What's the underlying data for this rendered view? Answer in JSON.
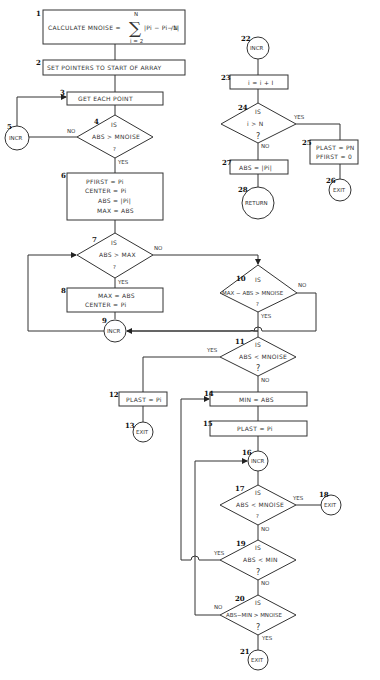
{
  "flowchart": {
    "nodes": {
      "n1": {
        "num": "1",
        "text": "CALCULATE  MNOISE =",
        "sum_upper": "N",
        "sum_lower": "i = 2",
        "sum_body": "|Pi − Pi−1|",
        "divisor": "/N"
      },
      "n2": {
        "num": "2",
        "text": "SET  POINTERS   TO  START  OF  ARRAY"
      },
      "n3": {
        "num": "3",
        "text": "GET    EACH    POINT"
      },
      "n4": {
        "num": "4",
        "is": "IS",
        "text": "ABS > MNOISE",
        "q": "?"
      },
      "n5": {
        "num": "5",
        "text": "INCR"
      },
      "n6": {
        "num": "6",
        "lines": [
          "PFIRST =  Pi",
          "CENTER =  Pi",
          "ABS =  |Pi|",
          "MAX =  ABS"
        ]
      },
      "n7": {
        "num": "7",
        "is": "IS",
        "text": "ABS > MAX",
        "q": "?"
      },
      "n8": {
        "num": "8",
        "lines": [
          "MAX = ABS",
          "CENTER =  Pi"
        ]
      },
      "n9": {
        "num": "9",
        "text": "INCR"
      },
      "n10": {
        "num": "10",
        "is": "IS",
        "text": "MAX − ABS > MNOISE",
        "q": "?"
      },
      "n11": {
        "num": "11",
        "is": "IS",
        "text": "ABS < MNOISE",
        "q": "?"
      },
      "n12": {
        "num": "12",
        "text": "PLAST = Pi"
      },
      "n13": {
        "num": "13",
        "text": "EXIT"
      },
      "n14": {
        "num": "14",
        "text": "MIN  =  ABS"
      },
      "n15": {
        "num": "15",
        "text": "PLAST  =  Pi"
      },
      "n16": {
        "num": "16",
        "text": "INCR"
      },
      "n17": {
        "num": "17",
        "is": "IS",
        "text": "ABS < MNOISE",
        "q": "?"
      },
      "n18": {
        "num": "18",
        "text": "EXIT"
      },
      "n19": {
        "num": "19",
        "is": "IS",
        "text": "ABS < MIN",
        "q": "?"
      },
      "n20": {
        "num": "20",
        "is": "IS",
        "text": "ABS−MIN > MNOISE",
        "q": "?"
      },
      "n21": {
        "num": "21",
        "text": "EXIT"
      },
      "n22": {
        "num": "22",
        "text": "INCR"
      },
      "n23": {
        "num": "23",
        "text": "i = i + I"
      },
      "n24": {
        "num": "24",
        "is": "IS",
        "text": "i  >  N",
        "q": "?"
      },
      "n25": {
        "num": "25",
        "lines": [
          "PLAST = PN",
          "PFIRST = 0"
        ]
      },
      "n26": {
        "num": "26",
        "text": "EXIT"
      },
      "n27": {
        "num": "27",
        "text": "ABS = |Pi|"
      },
      "n28": {
        "num": "28",
        "text": "RETURN"
      }
    },
    "edge_labels": {
      "yes": "YES",
      "no": "NO"
    }
  }
}
